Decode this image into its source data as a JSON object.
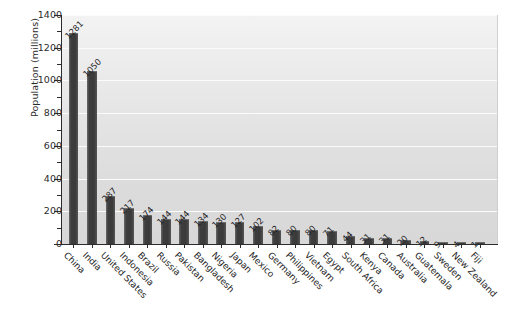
{
  "chart_data": {
    "type": "bar",
    "title": "",
    "xlabel": "",
    "ylabel": "Population (millions)",
    "ylim": [
      0,
      1400
    ],
    "ytick_step": 200,
    "yminor_step": 100,
    "grid": "horizontal",
    "legend": "none",
    "bar_color": "#3d3d3d",
    "plot_bg": "#e3e3e3",
    "value_labels": true,
    "categories": [
      "China",
      "India",
      "United States",
      "Indonesia",
      "Brazil",
      "Russia",
      "Pakistan",
      "Bangladesh",
      "Nigeria",
      "Japan",
      "Mexico",
      "Germany",
      "Philippines",
      "Vietnam",
      "Egypt",
      "South Africa",
      "Kenya",
      "Canada",
      "Australia",
      "Guatemala",
      "Sweden",
      "New Zealand",
      "Fiji"
    ],
    "values": [
      1281,
      1050,
      287,
      217,
      174,
      144,
      144,
      134,
      130,
      127,
      102,
      82,
      80,
      80,
      71,
      44,
      31,
      31,
      20,
      12,
      9,
      4,
      1
    ],
    "ytick_labels": [
      "0",
      "200",
      "400",
      "600",
      "800",
      "1000",
      "1200",
      "1400"
    ],
    "ytick_values": [
      0,
      200,
      400,
      600,
      800,
      1000,
      1200,
      1400
    ]
  }
}
